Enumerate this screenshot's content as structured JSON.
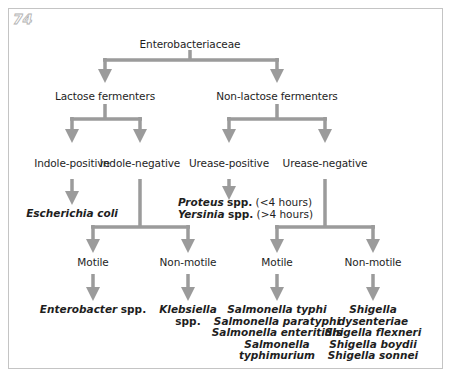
{
  "figure_number": "74",
  "colors": {
    "arrow": "#9b9b9b",
    "text": "#1e1e1e",
    "frame": "#c4c4c4"
  },
  "tree": {
    "root": "Enterobacteriaceae",
    "level1": {
      "left": "Lactose fermenters",
      "right": "Non-lactose fermenters"
    },
    "level2": {
      "indole_positive": "Indole-positive",
      "indole_negative": "Indole-negative",
      "urease_positive": "Urease-positive",
      "urease_negative": "Urease-negative"
    },
    "level3": {
      "indole_negative_motile": "Motile",
      "indole_negative_nonmotile": "Non-motile",
      "urease_negative_motile": "Motile",
      "urease_negative_nonmotile": "Non-motile"
    },
    "results": {
      "escherichia": "Escherichia coli",
      "proteus": {
        "genus": "Proteus",
        "suffix": "spp.",
        "note": "(<4 hours)"
      },
      "yersinia": {
        "genus": "Yersinia",
        "suffix": "spp.",
        "note": "(>4 hours)"
      },
      "enterobacter": {
        "genus": "Enterobacter",
        "suffix": "spp."
      },
      "klebsiella": {
        "genus": "Klebsiella",
        "suffix": "spp."
      },
      "salmonella": [
        "Salmonella typhi",
        "Salmonella paratyphi",
        "Salmonella enteritidis",
        "Salmonella",
        "typhimurium"
      ],
      "shigella": [
        "Shigella",
        "dysenteriae",
        "Shigella flexneri",
        "Shigella boydii",
        "Shigella sonnei"
      ]
    }
  }
}
